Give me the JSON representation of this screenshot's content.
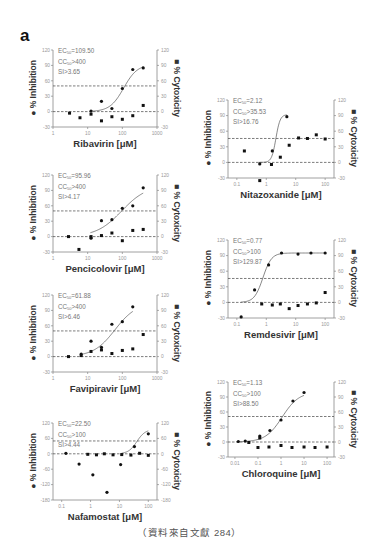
{
  "figure": {
    "panel_label": "a",
    "source_note": "（資料來自文獻 284）"
  },
  "chart_data": [
    {
      "type": "scatter",
      "title": "Ribavirin",
      "xlabel": "Ribavirin [μM]",
      "ylabel_left": "% Inhibition",
      "ylabel_right": "% Cytoxicity",
      "xscale": "log",
      "xlim": [
        1,
        1000
      ],
      "xticks": [
        "1",
        "10",
        "100",
        "1000"
      ],
      "ylim": [
        -30,
        120
      ],
      "yticks": [
        -30,
        0,
        30,
        60,
        90,
        120
      ],
      "stats": {
        "ec50": "EC50=109.50",
        "cc50": "CC50>400",
        "si": "SI>3.65"
      },
      "ref_lines": [
        0,
        50
      ],
      "series": [
        {
          "name": "% Inhibition",
          "x": [
            12.5,
            25,
            50,
            100,
            200,
            400
          ],
          "y": [
            1,
            20,
            6,
            45,
            82,
            85
          ]
        },
        {
          "name": "% Cytoxicity",
          "x": [
            3,
            6,
            12.5,
            25,
            50,
            100,
            200,
            400
          ],
          "y": [
            -3,
            -12,
            -5,
            -18,
            -10,
            -15,
            -8,
            12
          ]
        }
      ],
      "fit": {
        "bottom": 0,
        "top": 92,
        "ec50": 109.5,
        "hill": 2.2,
        "xmin": 12,
        "xmax": 400
      }
    },
    {
      "type": "scatter",
      "title": "Nitazoxanide",
      "xlabel": "Nitazoxanide [μM]",
      "ylabel_left": "% Inhibition",
      "ylabel_right": "% Cytoxicity",
      "xscale": "log",
      "xlim": [
        0.05,
        200
      ],
      "xticks": [
        "0.1",
        "1",
        "10",
        "100"
      ],
      "ylim": [
        -30,
        120
      ],
      "yticks": [
        -30,
        0,
        30,
        60,
        90,
        120
      ],
      "stats": {
        "ec50": "EC50=2.12",
        "cc50": "CC50>35.53",
        "si": "SI>16.76"
      },
      "ref_lines": [
        0,
        46
      ],
      "series": [
        {
          "name": "% Inhibition",
          "x": [
            0.6,
            1.6,
            5
          ],
          "y": [
            -3,
            22,
            88
          ]
        },
        {
          "name": "% Cytoxicity",
          "x": [
            0.18,
            0.6,
            1.5,
            3,
            6,
            12.5,
            25,
            50,
            100
          ],
          "y": [
            22,
            -35,
            -4,
            10,
            33,
            47,
            46,
            53,
            45
          ]
        }
      ],
      "fit": {
        "bottom": 0,
        "top": 92,
        "ec50": 2.12,
        "hill": 6,
        "xmin": 0.55,
        "xmax": 5
      }
    },
    {
      "type": "scatter",
      "title": "Pencicolovir",
      "xlabel": "Pencicolovir [μM]",
      "ylabel_left": "% Inhibition",
      "ylabel_right": "% Cytoxicity",
      "xscale": "log",
      "xlim": [
        1,
        1000
      ],
      "xticks": [
        "1",
        "10",
        "100",
        "1000"
      ],
      "ylim": [
        -30,
        120
      ],
      "yticks": [
        -30,
        0,
        30,
        60,
        90,
        120
      ],
      "stats": {
        "ec50": "EC50=95.96",
        "cc50": "CC50>400",
        "si": "SI>4.17"
      },
      "ref_lines": [
        0,
        50
      ],
      "series": [
        {
          "name": "% Inhibition",
          "x": [
            12.5,
            25,
            50,
            100,
            200,
            400
          ],
          "y": [
            -3,
            31,
            33,
            55,
            60,
            95
          ]
        },
        {
          "name": "% Cytoxicity",
          "x": [
            2.8,
            5.6,
            12.5,
            25,
            50,
            100,
            200,
            400
          ],
          "y": [
            0,
            -25,
            0,
            2,
            7,
            -8,
            12,
            14
          ]
        }
      ],
      "fit": {
        "bottom": 0,
        "top": 100,
        "ec50": 95.96,
        "hill": 1.2,
        "xmin": 12,
        "xmax": 400
      }
    },
    {
      "type": "scatter",
      "title": "Remdesivir",
      "xlabel": "Remdesivir [μM]",
      "ylabel_left": "% Inhibition",
      "ylabel_right": "% Cytoxicity",
      "xscale": "log",
      "xlim": [
        0.05,
        200
      ],
      "xticks": [
        "0.1",
        "1",
        "10",
        "100"
      ],
      "ylim": [
        -30,
        120
      ],
      "yticks": [
        -30,
        0,
        30,
        60,
        90,
        120
      ],
      "stats": {
        "ec50": "EC50=0.77",
        "cc50": "CC50>100",
        "si": "SI>129.87"
      },
      "ref_lines": [
        0,
        46
      ],
      "series": [
        {
          "name": "% Inhibition",
          "x": [
            0.14,
            0.4,
            1.2,
            3.3,
            12,
            33,
            100
          ],
          "y": [
            -28,
            24,
            72,
            95,
            93,
            95,
            95
          ]
        },
        {
          "name": "% Cytoxicity",
          "x": [
            0.7,
            1.6,
            3,
            6,
            12,
            25,
            50,
            100
          ],
          "y": [
            -3,
            -5,
            -3,
            -12,
            -6,
            -3,
            -1,
            19
          ]
        }
      ],
      "fit": {
        "bottom": 0,
        "top": 95,
        "ec50": 0.77,
        "hill": 3,
        "xmin": 0.14,
        "xmax": 100
      }
    },
    {
      "type": "scatter",
      "title": "Favipiravir",
      "xlabel": "Favipiravir [μM]",
      "ylabel_left": "% Inhibition",
      "ylabel_right": "% Cytoxicity",
      "xscale": "log",
      "xlim": [
        1,
        1000
      ],
      "xticks": [
        "1",
        "10",
        "100",
        "1000"
      ],
      "ylim": [
        -30,
        120
      ],
      "yticks": [
        -30,
        0,
        30,
        60,
        90,
        120
      ],
      "stats": {
        "ec50": "EC50=61.88",
        "cc50": "CC50>400",
        "si": "SI>6.46"
      },
      "ref_lines": [
        0,
        50
      ],
      "series": [
        {
          "name": "% Inhibition",
          "x": [
            6.5,
            12.5,
            25,
            50,
            100,
            200
          ],
          "y": [
            5,
            30,
            18,
            63,
            68,
            97
          ]
        },
        {
          "name": "% Cytoxicity",
          "x": [
            2.8,
            6.5,
            12.5,
            25,
            50,
            100,
            200,
            400
          ],
          "y": [
            0,
            2,
            10,
            13,
            6,
            12,
            15,
            43
          ]
        }
      ],
      "fit": {
        "bottom": 0,
        "top": 105,
        "ec50": 61.88,
        "hill": 1.4,
        "xmin": 6.5,
        "xmax": 200
      }
    },
    {
      "type": "scatter",
      "title": "Chloroquine",
      "xlabel": "Chloroquine [μM]",
      "ylabel_left": "% Inhibition",
      "ylabel_right": "% Cytoxicity",
      "xscale": "log",
      "xlim": [
        0.005,
        200
      ],
      "xticks": [
        "0.01",
        "0.1",
        "1",
        "10",
        "100"
      ],
      "ylim": [
        -30,
        120
      ],
      "yticks": [
        -30,
        0,
        30,
        60,
        90,
        120
      ],
      "stats": {
        "ec50": "EC50=1.13",
        "cc50": "CC50>100",
        "si": "SI>88.50"
      },
      "ref_lines": [
        0,
        51
      ],
      "series": [
        {
          "name": "% Inhibition",
          "x": [
            0.014,
            0.028,
            0.12,
            0.33,
            1,
            3.3,
            10
          ],
          "y": [
            1,
            2,
            12,
            23,
            44,
            82,
            99
          ]
        },
        {
          "name": "% Cytoxicity",
          "x": [
            0.04,
            0.12,
            0.1,
            0.3,
            1,
            3,
            10,
            30,
            100
          ],
          "y": [
            -1,
            8,
            -11,
            -10,
            -7,
            -11,
            -10,
            -11,
            -10
          ]
        }
      ],
      "fit": {
        "bottom": 0,
        "top": 100,
        "ec50": 1.13,
        "hill": 1.2,
        "xmin": 0.012,
        "xmax": 10
      }
    },
    {
      "type": "scatter",
      "title": "Nafamostat",
      "xlabel": "Nafamostat [μM]",
      "ylabel_left": "% Inhibition",
      "ylabel_right": "% Cytoxicity",
      "xscale": "log",
      "xlim": [
        0.05,
        200
      ],
      "xticks": [
        "0.1",
        "1",
        "10",
        "100"
      ],
      "ylim": [
        -180,
        120
      ],
      "yticks": [
        -180,
        -120,
        -60,
        0,
        60,
        120
      ],
      "ytick_labels_right": [
        "-180",
        "-120",
        "-60",
        "0",
        "60",
        "120"
      ],
      "stats": {
        "ec50": "EC50=22.50",
        "cc50": "CC50>100",
        "si": "SI>4.44"
      },
      "ref_lines": [
        0,
        50
      ],
      "series": [
        {
          "name": "% Inhibition",
          "x": [
            0.14,
            0.4,
            1.2,
            3.7,
            11,
            33,
            100
          ],
          "y": [
            2,
            -40,
            -82,
            -150,
            -42,
            28,
            78
          ]
        },
        {
          "name": "% Cytoxicity",
          "x": [
            0.8,
            1.6,
            3,
            6,
            12,
            25,
            50,
            100
          ],
          "y": [
            -2,
            -4,
            0,
            -4,
            -3,
            -5,
            2,
            -6
          ]
        }
      ],
      "fit": {
        "bottom": 0,
        "top": 95,
        "ec50": 40,
        "hill": 3,
        "xmin": 12,
        "xmax": 100
      }
    }
  ]
}
